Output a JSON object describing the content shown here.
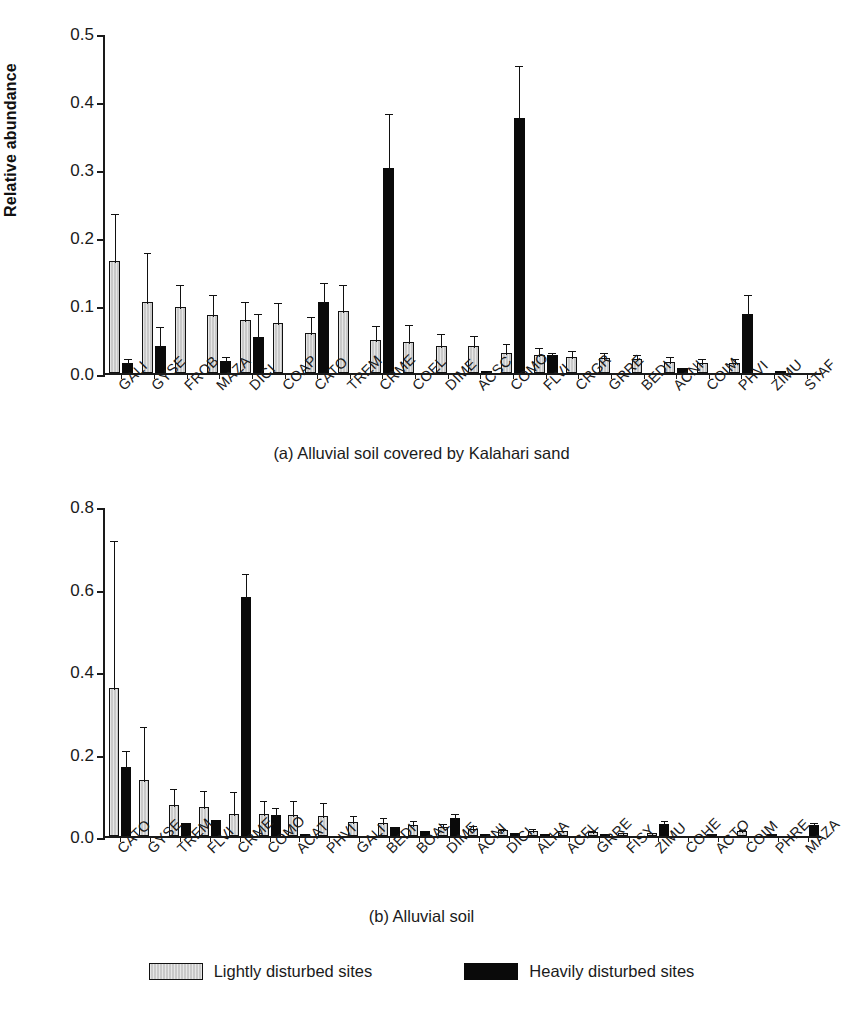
{
  "figure": {
    "y_axis_title": "Relative abundance",
    "legend": [
      {
        "key": "light",
        "label": "Lightly disturbed sites",
        "color": "#c9c9c9"
      },
      {
        "key": "heavy",
        "label": "Heavily disturbed sites",
        "color": "#0a0a0a"
      }
    ]
  },
  "chart_data": [
    {
      "id": "panel-a",
      "type": "bar",
      "title": "(a) Alluvial soil covered by Kalahari sand",
      "xlabel": "",
      "ylabel": "Relative abundance",
      "ylim": [
        0.0,
        0.5
      ],
      "yticks": [
        0.0,
        0.1,
        0.2,
        0.3,
        0.4,
        0.5
      ],
      "ytick_labels": [
        "0.0",
        "0.1",
        "0.2",
        "0.3",
        "0.4",
        "0.5"
      ],
      "grid": false,
      "legend_position": "bottom",
      "categories": [
        "GALI",
        "GYSE",
        "FROB",
        "MAZA",
        "DICI",
        "COAP",
        "CATO",
        "TREM",
        "CRME",
        "COEL",
        "DIME",
        "ACSC",
        "COMO",
        "FLVI",
        "CRGR",
        "GRRE",
        "BEDI",
        "ACNI",
        "COIM",
        "PHVI",
        "ZIMU",
        "STAF"
      ],
      "series": [
        {
          "name": "Lightly disturbed sites",
          "values": [
            0.165,
            0.105,
            0.097,
            0.085,
            0.078,
            0.073,
            0.059,
            0.091,
            0.049,
            0.046,
            0.04,
            0.039,
            0.029,
            0.026,
            0.023,
            0.022,
            0.02,
            0.016,
            0.014,
            0.014,
            0.0,
            0.0
          ],
          "errors": [
            0.072,
            0.075,
            0.035,
            0.032,
            0.03,
            0.033,
            0.026,
            0.041,
            0.023,
            0.027,
            0.021,
            0.019,
            0.016,
            0.013,
            0.012,
            0.011,
            0.01,
            0.01,
            0.009,
            0.009,
            0.0,
            0.0
          ]
        },
        {
          "name": "Heavily disturbed sites",
          "values": [
            0.015,
            0.039,
            0.0,
            0.017,
            0.053,
            0.0,
            0.105,
            0.0,
            0.301,
            0.0,
            0.0,
            0.003,
            0.375,
            0.027,
            0.0,
            0.0,
            0.0,
            0.007,
            0.0,
            0.087,
            0.002,
            0.0
          ],
          "errors": [
            0.009,
            0.031,
            0.0,
            0.009,
            0.037,
            0.0,
            0.03,
            0.0,
            0.083,
            0.0,
            0.0,
            0.0,
            0.08,
            0.006,
            0.0,
            0.0,
            0.0,
            0.0,
            0.0,
            0.03,
            0.0,
            0.0
          ]
        }
      ]
    },
    {
      "id": "panel-b",
      "type": "bar",
      "title": "(b) Alluvial soil",
      "xlabel": "",
      "ylabel": "Relative abundance",
      "ylim": [
        0.0,
        0.8
      ],
      "yticks": [
        0.0,
        0.2,
        0.4,
        0.6,
        0.8
      ],
      "ytick_labels": [
        "0.0",
        "0.2",
        "0.4",
        "0.6",
        "0.8"
      ],
      "grid": false,
      "legend_position": "bottom",
      "categories": [
        "CATO",
        "GYSE",
        "TREM",
        "FLVI",
        "CRME",
        "COMO",
        "ACAT",
        "PHVI",
        "GALI",
        "BEDI",
        "BOAL",
        "DIME",
        "ACNI",
        "DICI",
        "ALHA",
        "ACFL",
        "GRRE",
        "FISY",
        "ZIMU",
        "COHE",
        "ACTO",
        "COIM",
        "PHRE",
        "MAZA"
      ],
      "series": [
        {
          "name": "Lightly disturbed sites",
          "values": [
            0.358,
            0.135,
            0.076,
            0.07,
            0.053,
            0.053,
            0.052,
            0.048,
            0.033,
            0.031,
            0.026,
            0.021,
            0.018,
            0.014,
            0.013,
            0.011,
            0.01,
            0.008,
            0.008,
            0.0,
            0.002,
            0.012,
            0.006,
            0.0
          ],
          "errors": [
            0.362,
            0.133,
            0.044,
            0.044,
            0.058,
            0.037,
            0.038,
            0.038,
            0.02,
            0.018,
            0.016,
            0.013,
            0.011,
            0.009,
            0.008,
            0.007,
            0.006,
            0.005,
            0.005,
            0.0,
            0.002,
            0.007,
            0.004,
            0.0
          ]
        },
        {
          "name": "Heavily disturbed sites",
          "values": [
            0.168,
            0.0,
            0.032,
            0.04,
            0.58,
            0.05,
            0.005,
            0.0,
            0.0,
            0.022,
            0.012,
            0.043,
            0.006,
            0.008,
            0.006,
            0.0,
            0.002,
            0.0,
            0.03,
            0.0,
            0.0,
            0.0,
            0.0,
            0.027
          ],
          "errors": [
            0.043,
            0.0,
            0.0,
            0.0,
            0.06,
            0.022,
            0.0,
            0.0,
            0.0,
            0.0,
            0.0,
            0.015,
            0.0,
            0.0,
            0.0,
            0.0,
            0.0,
            0.0,
            0.012,
            0.0,
            0.0,
            0.0,
            0.0,
            0.01
          ]
        }
      ]
    }
  ]
}
